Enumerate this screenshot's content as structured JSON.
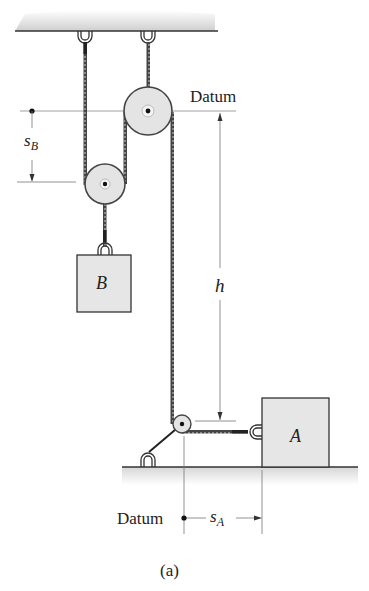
{
  "figure": {
    "caption": "(a)",
    "labels": {
      "datum_top": "Datum",
      "datum_bottom": "Datum",
      "s_b": "s",
      "s_b_sub": "B",
      "s_a": "s",
      "s_a_sub": "A",
      "h": "h",
      "block_a": "A",
      "block_b": "B"
    },
    "colors": {
      "ceiling_fill": "#d9d9d9",
      "ground_fill": "#e2e2e2",
      "block_fill": "#e6e6e6",
      "pulley_fill": "#e4e4e4",
      "line": "#333333",
      "dimension_line": "#777777"
    }
  }
}
